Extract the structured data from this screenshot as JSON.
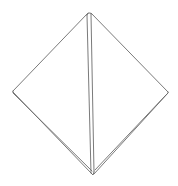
{
  "drawing": {
    "subject": "pyramid-sketch",
    "stroke_color": "#6b6b6b",
    "background": "#ffffff",
    "vertices": {
      "top": [
        89,
        13
      ],
      "left": [
        13,
        92
      ],
      "right": [
        168,
        93
      ],
      "bottom": [
        93,
        174
      ]
    }
  }
}
